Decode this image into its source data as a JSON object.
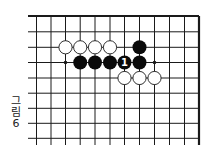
{
  "figure": {
    "caption_chars": [
      "그",
      "림",
      "6"
    ],
    "caption": "그림 6"
  },
  "board": {
    "colors": {
      "background": "#ffffff",
      "line": "#1a1a1a",
      "black_stone": "#0a0a0a",
      "white_stone_fill": "#ffffff",
      "white_stone_stroke": "#1a1a1a",
      "label_on_black": "#ffffff"
    },
    "cols_x": [
      36.5,
      51,
      65.5,
      80.2,
      95,
      110,
      124.5,
      139.5,
      154.5,
      169.5,
      184.5,
      199
    ],
    "rows_y": [
      16,
      31.8,
      47.3,
      62.5,
      78,
      93.2,
      108.3,
      123.3,
      138.3
    ],
    "left_extent_x": 28,
    "bottom_extent_y": 145,
    "top_edge": true,
    "right_edge": true,
    "stone_radius": 7,
    "stones": [
      {
        "color": "white",
        "col": 2,
        "row": 2
      },
      {
        "color": "white",
        "col": 3,
        "row": 2
      },
      {
        "color": "white",
        "col": 4,
        "row": 2
      },
      {
        "color": "white",
        "col": 5,
        "row": 2
      },
      {
        "color": "black",
        "col": 7,
        "row": 2
      },
      {
        "color": "black",
        "col": 3,
        "row": 3
      },
      {
        "color": "black",
        "col": 4,
        "row": 3
      },
      {
        "color": "black",
        "col": 5,
        "row": 3
      },
      {
        "color": "black",
        "col": 6,
        "row": 3,
        "label": "1"
      },
      {
        "color": "black",
        "col": 7,
        "row": 3
      },
      {
        "color": "white",
        "col": 6,
        "row": 4
      },
      {
        "color": "white",
        "col": 7,
        "row": 4
      },
      {
        "color": "white",
        "col": 8,
        "row": 4
      }
    ],
    "marks": [
      {
        "type": "dot",
        "col": 2,
        "row": 3
      },
      {
        "type": "dot",
        "col": 8,
        "row": 3
      }
    ]
  }
}
